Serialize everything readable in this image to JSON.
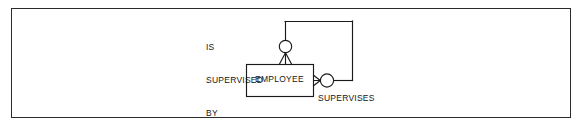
{
  "figure": {
    "kind": "entity-relationship-diagram",
    "notation": "crows-foot",
    "background_color": "#ffffff",
    "line_color": "#1a1a1a",
    "text_color": "#161616",
    "frame_color": "#2b2b2b"
  },
  "entity": {
    "name": "EMPLOYEE",
    "shape": "rectangle",
    "x": 246,
    "y": 64,
    "width": 67,
    "height": 32
  },
  "relationships": [
    {
      "id": "is-supervised-by",
      "label_lines": [
        "IS",
        "SUPERVISED",
        "BY"
      ],
      "label_text": "IS SUPERVISED BY",
      "side": "top",
      "cardinality": "zero-or-many",
      "markers": [
        "circle",
        "crows-foot"
      ]
    },
    {
      "id": "supervises",
      "label_lines": [
        "SUPERVISES"
      ],
      "label_text": "SUPERVISES",
      "side": "right",
      "cardinality": "zero-or-many",
      "markers": [
        "crows-foot",
        "circle"
      ]
    }
  ],
  "connector": {
    "description": "recursive self-loop routed from top of entity, right, and back into right side of entity",
    "path_points": [
      [
        285,
        40
      ],
      [
        285,
        21
      ],
      [
        352,
        21
      ],
      [
        352,
        80
      ],
      [
        334,
        80
      ]
    ]
  }
}
